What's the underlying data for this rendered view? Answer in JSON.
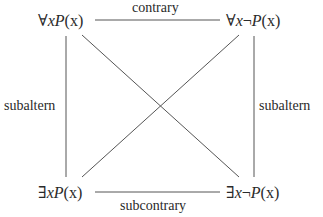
{
  "diagram": {
    "nodes": {
      "top_left": {
        "q": "∀",
        "v": "x",
        "p": "P",
        "args": "(x)",
        "neg": ""
      },
      "top_right": {
        "q": "∀",
        "v": "x",
        "p": "P",
        "args": "(x)",
        "neg": "¬"
      },
      "bottom_left": {
        "q": "∃",
        "v": "x",
        "p": "P",
        "args": "(x)",
        "neg": ""
      },
      "bottom_right": {
        "q": "∃",
        "v": "x",
        "p": "P",
        "args": "(x)",
        "neg": "¬"
      }
    },
    "edges": {
      "top": "contrary",
      "bottom": "subcontrary",
      "left": "subaltern",
      "right": "subaltern"
    },
    "line_color": "#555555"
  }
}
